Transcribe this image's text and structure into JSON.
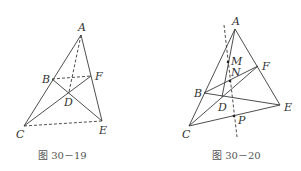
{
  "figures": [
    {
      "caption": "图 30－19",
      "points": {
        "A": {
          "label": "A",
          "x": 81,
          "y": 35
        },
        "B": {
          "label": "B",
          "x": 52,
          "y": 79
        },
        "F": {
          "label": "F",
          "x": 91,
          "y": 76
        },
        "D": {
          "label": "D",
          "x": 69,
          "y": 92
        },
        "C": {
          "label": "C",
          "x": 24,
          "y": 126
        },
        "E": {
          "label": "E",
          "x": 102,
          "y": 121
        }
      },
      "solid_segments": [
        "AC",
        "AE",
        "BE",
        "CF"
      ],
      "dashed_segments": [
        "AD",
        "BF",
        "CE"
      ]
    },
    {
      "caption": "图 30－20",
      "points": {
        "A": {
          "label": "A",
          "x": 235,
          "y": 29
        },
        "M": {
          "label": "M",
          "x": 228,
          "y": 62
        },
        "N": {
          "label": "N",
          "x": 230,
          "y": 81
        },
        "F": {
          "label": "F",
          "x": 258,
          "y": 66
        },
        "B": {
          "label": "B",
          "x": 204,
          "y": 93
        },
        "D": {
          "label": "D",
          "x": 222,
          "y": 97
        },
        "E": {
          "label": "E",
          "x": 280,
          "y": 105
        },
        "P": {
          "label": "P",
          "x": 234,
          "y": 116
        },
        "C": {
          "label": "C",
          "x": 189,
          "y": 126
        }
      },
      "solid_segments": [
        "AC",
        "AE",
        "CE",
        "BE",
        "CF",
        "BF",
        "AD"
      ],
      "dashed_segments": [
        "MP extended"
      ]
    }
  ]
}
